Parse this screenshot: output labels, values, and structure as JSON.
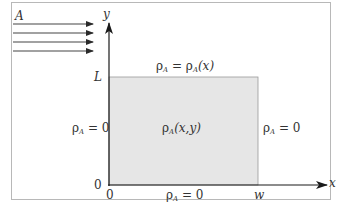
{
  "diagram": {
    "type": "2D concentration domain with uniform flow",
    "flow": {
      "label": "A",
      "arrow_count": 4,
      "direction": "right"
    },
    "axes": {
      "x_label": "x",
      "y_label": "y",
      "origin_x_label": "0",
      "origin_y_label": "0",
      "x_end_label": "w",
      "y_end_label": "L"
    },
    "region": {
      "interior_label_base": "ρ",
      "interior_label_sub": "A",
      "interior_label_args": "(x,y)",
      "fill_color": "#e6e6e6"
    },
    "boundary_conditions": {
      "top": {
        "lhs_base": "ρ",
        "lhs_sub": "A",
        "eq": " = ",
        "rhs_base": "ρ",
        "rhs_sub": "A",
        "rhs_args": "(x)"
      },
      "left": {
        "base": "ρ",
        "sub": "A",
        "rest": " = 0"
      },
      "right": {
        "base": "ρ",
        "sub": "A",
        "rest": " = 0"
      },
      "bottom": {
        "base": "ρ",
        "sub": "A",
        "rest": " = 0"
      }
    }
  }
}
